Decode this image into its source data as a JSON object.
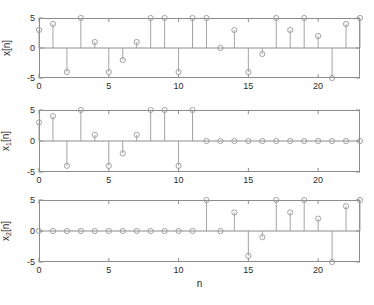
{
  "figure": {
    "background": "#ffffff",
    "axis_color": "#8c8c8c",
    "stem_color": "#9a9a9a",
    "marker_color": "#9a9a9a",
    "text_color": "#2b2b2b",
    "xlabel": "n"
  },
  "chart_data": [
    {
      "type": "line",
      "plot_style": "stem",
      "title": "",
      "ylabel": "x[n]",
      "ylabel_base": "x",
      "ylabel_sub": "",
      "ylabel_tail": "[n]",
      "xlabel": "",
      "x": [
        0,
        1,
        2,
        3,
        4,
        5,
        6,
        7,
        8,
        9,
        10,
        11,
        12,
        13,
        14,
        15,
        16,
        17,
        18,
        19,
        20,
        21,
        22,
        23
      ],
      "values": [
        3,
        4,
        -4,
        5,
        1,
        -4,
        -2,
        1,
        5,
        5,
        -4,
        5,
        5,
        0,
        3,
        -4,
        -1,
        5,
        3,
        5,
        2,
        -5,
        4,
        5
      ],
      "xlim": [
        0,
        23
      ],
      "ylim": [
        -5,
        5
      ],
      "xticks": [
        0,
        5,
        10,
        15,
        20
      ],
      "xticklabels": [
        "0",
        "5",
        "10",
        "15",
        "20"
      ],
      "yticks": [
        -5,
        0,
        5
      ],
      "yticklabels": [
        "-5",
        "0",
        "5"
      ],
      "grid": false,
      "legend": "none",
      "zero_line": true
    },
    {
      "type": "line",
      "plot_style": "stem",
      "title": "",
      "ylabel": "x1[n]",
      "ylabel_base": "x",
      "ylabel_sub": "1",
      "ylabel_tail": "[n]",
      "xlabel": "",
      "x": [
        0,
        1,
        2,
        3,
        4,
        5,
        6,
        7,
        8,
        9,
        10,
        11,
        12,
        13,
        14,
        15,
        16,
        17,
        18,
        19,
        20,
        21,
        22,
        23
      ],
      "values": [
        3,
        4,
        -4,
        5,
        1,
        -4,
        -2,
        1,
        5,
        5,
        -4,
        5,
        0,
        0,
        0,
        0,
        0,
        0,
        0,
        0,
        0,
        0,
        0,
        0
      ],
      "xlim": [
        0,
        23
      ],
      "ylim": [
        -5,
        5
      ],
      "xticks": [
        0,
        5,
        10,
        15,
        20
      ],
      "xticklabels": [
        "0",
        "5",
        "10",
        "15",
        "20"
      ],
      "yticks": [
        -5,
        0,
        5
      ],
      "yticklabels": [
        "-5",
        "0",
        "5"
      ],
      "grid": false,
      "legend": "none",
      "zero_line": true
    },
    {
      "type": "line",
      "plot_style": "stem",
      "title": "",
      "ylabel": "x2[n]",
      "ylabel_base": "x",
      "ylabel_sub": "2",
      "ylabel_tail": "[n]",
      "xlabel": "n",
      "x": [
        0,
        1,
        2,
        3,
        4,
        5,
        6,
        7,
        8,
        9,
        10,
        11,
        12,
        13,
        14,
        15,
        16,
        17,
        18,
        19,
        20,
        21,
        22,
        23
      ],
      "values": [
        0,
        0,
        0,
        0,
        0,
        0,
        0,
        0,
        0,
        0,
        0,
        0,
        5,
        0,
        3,
        -4,
        -1,
        5,
        3,
        5,
        2,
        -5,
        4,
        5
      ],
      "xlim": [
        0,
        23
      ],
      "ylim": [
        -5,
        5
      ],
      "xticks": [
        0,
        5,
        10,
        15,
        20
      ],
      "xticklabels": [
        "0",
        "5",
        "10",
        "15",
        "20"
      ],
      "yticks": [
        -5,
        0,
        5
      ],
      "yticklabels": [
        "-5",
        "0",
        "5"
      ],
      "grid": false,
      "legend": "none",
      "zero_line": true
    }
  ]
}
